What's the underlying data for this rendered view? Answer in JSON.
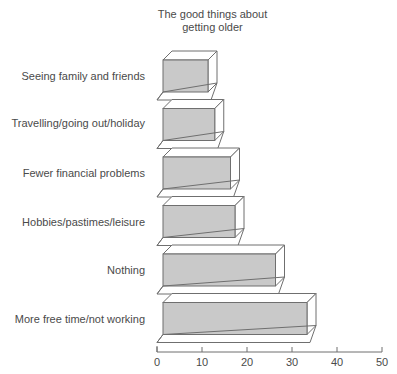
{
  "chart_data": {
    "type": "bar",
    "orientation": "horizontal",
    "style": "3d",
    "title": "The good things about\ngetting older",
    "title_lines": [
      "The good things about",
      "getting older"
    ],
    "xlabel": "",
    "ylabel": "",
    "categories": [
      "Seeing family and friends",
      "Travelling/going out/holiday",
      "Fewer financial problems",
      "Hobbies/pastimes/leisure",
      "Nothing",
      "More free time/not working"
    ],
    "values": [
      10,
      11.5,
      15,
      16,
      25,
      32
    ],
    "xlim": [
      0,
      50
    ],
    "xticks": [
      0,
      10,
      20,
      30,
      40,
      50
    ],
    "xtick_labels": [
      "0",
      "10",
      "20",
      "30",
      "40",
      "50"
    ],
    "grid": false,
    "legend": false,
    "bar_fill_color": "#c9c9c9",
    "bar_edge_color": "#6f6f6f",
    "bar_top_color": "#ffffff",
    "bar_side_color": "#ffffff",
    "axis_color": "#6f6f6f",
    "text_color": "#4a4a4a",
    "background_color": "#ffffff"
  }
}
